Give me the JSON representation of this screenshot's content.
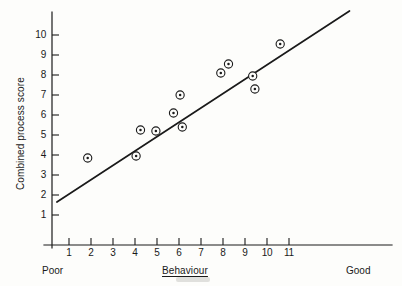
{
  "chart_data": {
    "type": "scatter",
    "title": "",
    "xlabel": "Behaviour",
    "ylabel": "Combined process score",
    "xlim": [
      0,
      12
    ],
    "ylim": [
      0,
      11
    ],
    "grid": false,
    "legend": "none",
    "x_tick_labels": [
      "1",
      "2",
      "3",
      "4",
      "5",
      "6",
      "7",
      "8",
      "9",
      "10",
      "11"
    ],
    "x_ticks": [
      1,
      2,
      3,
      4,
      5,
      6,
      7,
      8,
      9,
      10,
      11
    ],
    "y_tick_labels": [
      "1",
      "2",
      "3",
      "4",
      "5",
      "6",
      "7",
      "8",
      "9",
      "10"
    ],
    "y_ticks": [
      1,
      2,
      3,
      4,
      5,
      6,
      7,
      8,
      9,
      10
    ],
    "x_axis_anchor_low": "Poor",
    "x_axis_anchor_high": "Good",
    "marker_style": "circled-dot",
    "points": [
      {
        "x": 1.85,
        "y": 3.85
      },
      {
        "x": 4.05,
        "y": 3.95
      },
      {
        "x": 4.25,
        "y": 5.25
      },
      {
        "x": 4.95,
        "y": 5.2
      },
      {
        "x": 5.75,
        "y": 6.1
      },
      {
        "x": 6.05,
        "y": 7.0
      },
      {
        "x": 6.15,
        "y": 5.4
      },
      {
        "x": 7.9,
        "y": 8.1
      },
      {
        "x": 8.25,
        "y": 8.55
      },
      {
        "x": 9.35,
        "y": 7.95
      },
      {
        "x": 9.45,
        "y": 7.3
      },
      {
        "x": 10.6,
        "y": 9.55
      }
    ],
    "trendline": {
      "type": "line",
      "x_start": 0.45,
      "y_start": 1.65,
      "x_end": 13.75,
      "y_end": 11.2,
      "slope": 0.72,
      "intercept": 1.33
    }
  },
  "axes": {
    "y_label": "Combined process score",
    "x_label": "Behaviour",
    "anchor_low": "Poor",
    "anchor_high": "Good"
  },
  "colors": {
    "ink": "#1a1a1a",
    "paper": "#fdfdfb",
    "axis": "#1a1a1a"
  }
}
